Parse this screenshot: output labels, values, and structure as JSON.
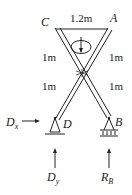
{
  "diagram": {
    "labels": {
      "C": "C",
      "A": "A",
      "B": "B",
      "D": "D",
      "top_dim": "1.2m",
      "left_upper_dim": "1m",
      "left_lower_dim": "1m",
      "right_upper_dim": "1m",
      "right_lower_dim": "1m",
      "Dx": "D",
      "Dx_sub": "x",
      "Dy": "D",
      "Dy_sub": "y",
      "RB": "R",
      "RB_sub": "B"
    },
    "colors": {
      "line": "#222222",
      "background": "#ffffff"
    }
  }
}
